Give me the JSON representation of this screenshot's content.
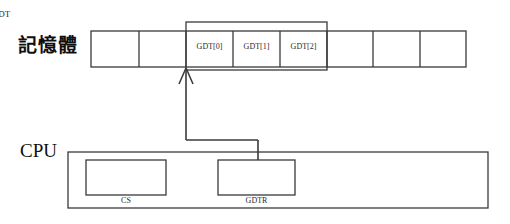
{
  "diagram": {
    "background_color": "#ffffff",
    "stroke_color": "#3a3a3a",
    "memory": {
      "label": "記憶體",
      "bracket_label": "GDT",
      "cells": [
        {
          "name": "mem-cell-0",
          "label": ""
        },
        {
          "name": "mem-cell-1",
          "label": ""
        },
        {
          "name": "gdt-entry-0",
          "label": "GDT[0]"
        },
        {
          "name": "gdt-entry-1",
          "label": "GDT[1]"
        },
        {
          "name": "gdt-entry-2",
          "label": "GDT[2]"
        },
        {
          "name": "mem-cell-5",
          "label": ""
        },
        {
          "name": "mem-cell-6",
          "label": ""
        },
        {
          "name": "mem-cell-7",
          "label": ""
        }
      ]
    },
    "cpu": {
      "label": "CPU",
      "registers": [
        {
          "name": "cs-register",
          "label": "CS"
        },
        {
          "name": "gdtr-register",
          "label": "GDTR"
        }
      ]
    },
    "connector": {
      "name": "gdtr-to-gdt-pointer",
      "from": "GDTR",
      "to": "GDT"
    }
  }
}
